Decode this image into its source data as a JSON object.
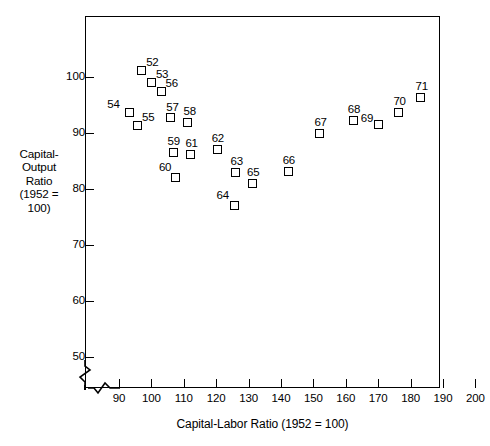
{
  "chart_data": {
    "type": "scatter",
    "title": "",
    "xlabel": "Capital-Labor Ratio (1952 = 100)",
    "ylabel": "Capital-Output Ratio (1952 = 100)",
    "ylabel_lines": [
      "Capital-",
      "Output",
      "Ratio",
      "(1952 =",
      "100)"
    ],
    "xlim": [
      86,
      200
    ],
    "ylim": [
      46,
      104
    ],
    "grid": false,
    "legend": "none",
    "axis_break_x": true,
    "axis_break_y": true,
    "xticks": [
      90,
      100,
      110,
      120,
      130,
      140,
      150,
      160,
      170,
      180,
      190,
      200
    ],
    "yticks": [
      50,
      60,
      70,
      80,
      90,
      100
    ],
    "marker_style": "open-square",
    "point_label_field": "year",
    "points": [
      {
        "year": "52",
        "x": 97.0,
        "y": 101.2,
        "label_dx": 9,
        "label_dy": -9
      },
      {
        "year": "53",
        "x": 100.0,
        "y": 99.0,
        "label_dx": 9,
        "label_dy": -9
      },
      {
        "year": "54",
        "x": 93.3,
        "y": 93.6,
        "label_dx": -18,
        "label_dy": -9
      },
      {
        "year": "55",
        "x": 95.7,
        "y": 91.4,
        "label_dx": 9,
        "label_dy": -9
      },
      {
        "year": "56",
        "x": 103.0,
        "y": 97.4,
        "label_dx": 9,
        "label_dy": -9
      },
      {
        "year": "57",
        "x": 106.0,
        "y": 92.8,
        "label_dx": 0,
        "label_dy": -11
      },
      {
        "year": "58",
        "x": 111.0,
        "y": 91.8,
        "label_dx": 1,
        "label_dy": -12
      },
      {
        "year": "59",
        "x": 106.7,
        "y": 86.6,
        "label_dx": -1,
        "label_dy": -12
      },
      {
        "year": "60",
        "x": 107.4,
        "y": 82.1,
        "label_dx": -12,
        "label_dy": -11
      },
      {
        "year": "61",
        "x": 112.2,
        "y": 86.1,
        "label_dx": -1,
        "label_dy": -12
      },
      {
        "year": "62",
        "x": 120.3,
        "y": 87.0,
        "label_dx": -1,
        "label_dy": -12
      },
      {
        "year": "63",
        "x": 126.1,
        "y": 82.9,
        "label_dx": -1,
        "label_dy": -12
      },
      {
        "year": "64",
        "x": 125.5,
        "y": 77.1,
        "label_dx": -13,
        "label_dy": -11
      },
      {
        "year": "65",
        "x": 131.2,
        "y": 81.0,
        "label_dx": -1,
        "label_dy": -12
      },
      {
        "year": "66",
        "x": 142.2,
        "y": 83.2,
        "label_dx": -1,
        "label_dy": -12
      },
      {
        "year": "67",
        "x": 152.0,
        "y": 89.9,
        "label_dx": -1,
        "label_dy": -12
      },
      {
        "year": "68",
        "x": 162.3,
        "y": 92.3,
        "label_dx": -1,
        "label_dy": -12
      },
      {
        "year": "69",
        "x": 170.0,
        "y": 91.5,
        "label_dx": -13,
        "label_dy": -7
      },
      {
        "year": "70",
        "x": 176.4,
        "y": 93.7,
        "label_dx": -1,
        "label_dy": -12
      },
      {
        "year": "71",
        "x": 183.2,
        "y": 96.3,
        "label_dx": -1,
        "label_dy": -12
      }
    ]
  }
}
